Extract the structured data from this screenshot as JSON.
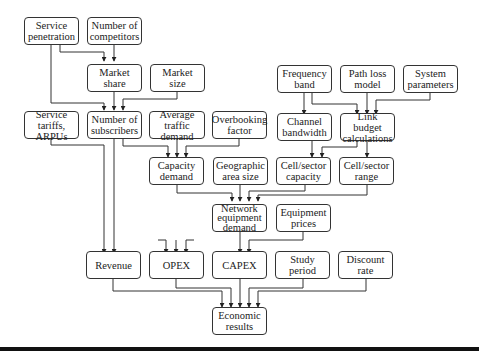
{
  "diagram": {
    "title": "",
    "nodes": {
      "service_penetration": "Service\npenetration",
      "number_of_competitors": "Number of\ncompetitors",
      "market_share": "Market\nshare",
      "market_size": "Market\nsize",
      "frequency_band": "Frequency\nband",
      "path_loss_model": "Path loss\nmodel",
      "system_parameters": "System\nparameters",
      "service_tariffs_arpus": "Service tariffs,\nARPUs",
      "number_of_subscribers": "Number of\nsubscribers",
      "average_traffic_demand": "Average traffic\ndemand",
      "overbooking_factor": "Overbooking\nfactor",
      "channel_bandwidth": "Channel\nbandwidth",
      "link_budget_calculations": "Link budget\ncalculations",
      "capacity_demand": "Capacity\ndemand",
      "geographic_area_size": "Geographic\narea size",
      "cell_sector_capacity": "Cell/sector\ncapacity",
      "cell_sector_range": "Cell/sector\nrange",
      "network_equipment_demand": "Network\nequipment\ndemand",
      "equipment_prices": "Equipment\nprices",
      "revenue": "Revenue",
      "opex": "OPEX",
      "capex": "CAPEX",
      "study_period": "Study\nperiod",
      "discount_rate": "Discount\nrate",
      "economic_results": "Economic\nresults"
    },
    "edges": [
      [
        "service_penetration",
        "market_share"
      ],
      [
        "number_of_competitors",
        "market_share"
      ],
      [
        "service_penetration",
        "number_of_subscribers"
      ],
      [
        "market_share",
        "number_of_subscribers"
      ],
      [
        "market_size",
        "number_of_subscribers"
      ],
      [
        "frequency_band",
        "channel_bandwidth"
      ],
      [
        "frequency_band",
        "link_budget_calculations"
      ],
      [
        "path_loss_model",
        "link_budget_calculations"
      ],
      [
        "system_parameters",
        "link_budget_calculations"
      ],
      [
        "number_of_subscribers",
        "capacity_demand"
      ],
      [
        "average_traffic_demand",
        "capacity_demand"
      ],
      [
        "overbooking_factor",
        "capacity_demand"
      ],
      [
        "channel_bandwidth",
        "cell_sector_capacity"
      ],
      [
        "link_budget_calculations",
        "cell_sector_capacity"
      ],
      [
        "link_budget_calculations",
        "cell_sector_range"
      ],
      [
        "capacity_demand",
        "network_equipment_demand"
      ],
      [
        "geographic_area_size",
        "network_equipment_demand"
      ],
      [
        "cell_sector_capacity",
        "network_equipment_demand"
      ],
      [
        "cell_sector_range",
        "network_equipment_demand"
      ],
      [
        "service_tariffs_arpus",
        "revenue"
      ],
      [
        "number_of_subscribers",
        "revenue"
      ],
      [
        "network_equipment_demand",
        "capex"
      ],
      [
        "equipment_prices",
        "capex"
      ],
      [
        "revenue",
        "economic_results"
      ],
      [
        "opex",
        "economic_results"
      ],
      [
        "capex",
        "economic_results"
      ],
      [
        "study_period",
        "economic_results"
      ],
      [
        "discount_rate",
        "economic_results"
      ]
    ]
  }
}
